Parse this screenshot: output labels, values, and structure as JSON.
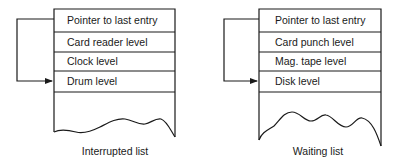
{
  "diagrams": [
    {
      "name": "interrupted-list",
      "caption": "Interrupted list",
      "rows": [
        "Pointer to last entry",
        "Card reader level",
        "Clock level",
        "Drum level"
      ]
    },
    {
      "name": "waiting-list",
      "caption": "Waiting list",
      "rows": [
        "Pointer to last entry",
        "Card punch level",
        "Mag. tape level",
        "Disk level"
      ]
    }
  ],
  "icons": {
    "pointer_arrow": "arrowhead-right"
  },
  "colors": {
    "line": "#1a1a1a",
    "background": "#ffffff"
  }
}
